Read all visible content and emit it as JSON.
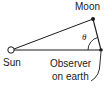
{
  "diagram": {
    "labels": {
      "moon": "Moon",
      "sun": "Sun",
      "observer_line1": "Observer",
      "observer_line2": "on earth",
      "angle": "θ"
    },
    "nodes": [
      {
        "id": "sun",
        "label": "Sun",
        "style": "open-circle"
      },
      {
        "id": "moon",
        "label": "Moon",
        "style": "filled-dot"
      },
      {
        "id": "observer",
        "label": "Observer on earth",
        "style": "filled-dot"
      }
    ],
    "edges": [
      {
        "from": "sun",
        "to": "moon"
      },
      {
        "from": "sun",
        "to": "observer"
      },
      {
        "from": "moon",
        "to": "observer"
      }
    ],
    "angle_marker": {
      "at": "observer",
      "between": [
        "moon",
        "sun"
      ],
      "label": "θ"
    },
    "colors": {
      "ink": "#1a1a1a",
      "background": "#ffffff"
    }
  }
}
